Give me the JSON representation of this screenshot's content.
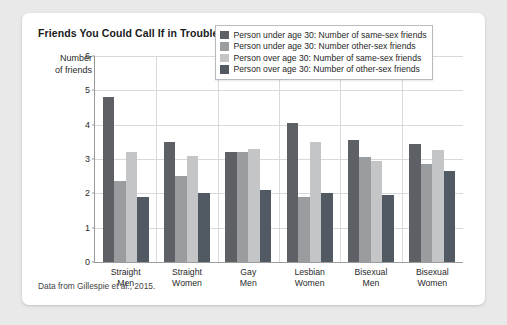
{
  "card": {
    "title": "Friends You Could Call If in Trouble Late at Night",
    "caption": "Data from Gillespie et al., 2015."
  },
  "axis": {
    "ylabel_line1": "Number",
    "ylabel_line2": "of friends",
    "yticks": [
      "6",
      "5",
      "4",
      "3",
      "2",
      "1",
      "0"
    ]
  },
  "legend": {
    "items": [
      {
        "label": "Person under age 30: Number of same-sex friends",
        "color": "#5d6166"
      },
      {
        "label": "Person under age 30: Number other-sex friends",
        "color": "#9a9da0"
      },
      {
        "label": "Person over age 30: Number of same-sex friends",
        "color": "#c3c5c7"
      },
      {
        "label": "Person over age 30: Number of other-sex friends",
        "color": "#515a63"
      }
    ]
  },
  "chart_data": {
    "type": "bar",
    "title": "Friends You Could Call If in Trouble Late at Night",
    "xlabel": "",
    "ylabel": "Number of friends",
    "ylim": [
      0,
      6
    ],
    "ytick_step": 1,
    "grid": true,
    "legend_position": "top-right-inside",
    "categories": [
      "Straight Men",
      "Straight Women",
      "Gay Men",
      "Lesbian Women",
      "Bisexual Men",
      "Bisexual Women"
    ],
    "category_lines": [
      [
        "Straight",
        "Men"
      ],
      [
        "Straight",
        "Women"
      ],
      [
        "Gay",
        "Men"
      ],
      [
        "Lesbian",
        "Women"
      ],
      [
        "Bisexual",
        "Men"
      ],
      [
        "Bisexual",
        "Women"
      ]
    ],
    "series": [
      {
        "name": "Person under age 30: Number of same-sex friends",
        "color": "#5d6166",
        "values": [
          4.8,
          3.5,
          3.2,
          4.05,
          3.55,
          3.45
        ]
      },
      {
        "name": "Person under age 30: Number other-sex friends",
        "color": "#9a9da0",
        "values": [
          2.35,
          2.5,
          3.2,
          1.9,
          3.05,
          2.85
        ]
      },
      {
        "name": "Person over age 30: Number of same-sex friends",
        "color": "#c3c5c7",
        "values": [
          3.2,
          3.1,
          3.3,
          3.5,
          2.95,
          3.25
        ]
      },
      {
        "name": "Person over age 30: Number of other-sex friends",
        "color": "#515a63",
        "values": [
          1.9,
          2.0,
          2.1,
          2.0,
          1.95,
          2.65
        ]
      }
    ]
  }
}
